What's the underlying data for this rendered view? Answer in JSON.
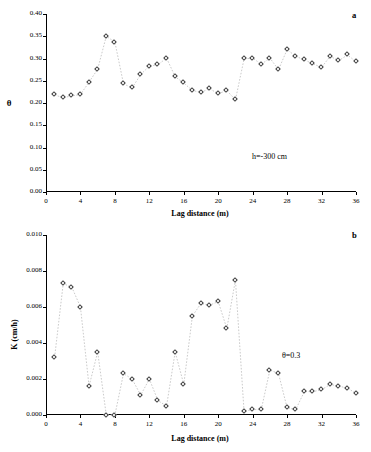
{
  "figure": {
    "panel_a_letter": "a",
    "panel_b_letter": "b"
  },
  "chart_data": [
    {
      "type": "scatter",
      "panel": "a",
      "title": "",
      "xlabel": "Lag distance (m)",
      "ylabel": "θ",
      "annotation": "h=-300 cm",
      "xlim": [
        0,
        36
      ],
      "ylim": [
        0.0,
        0.4
      ],
      "xticks": [
        0,
        4,
        8,
        12,
        16,
        20,
        24,
        28,
        32,
        36
      ],
      "yticks": [
        "0.00",
        "0.05",
        "0.10",
        "0.15",
        "0.20",
        "0.25",
        "0.30",
        "0.35",
        "0.40"
      ],
      "grid": false,
      "legend": "none",
      "marker": "open-diamond",
      "line": "dotted-gray",
      "x": [
        1,
        2,
        3,
        4,
        5,
        6,
        7,
        8,
        9,
        10,
        11,
        12,
        13,
        14,
        15,
        16,
        17,
        18,
        19,
        20,
        21,
        22,
        23,
        24,
        25,
        26,
        27,
        28,
        29,
        30,
        31,
        32,
        33,
        34,
        35,
        36
      ],
      "y": [
        0.218,
        0.212,
        0.216,
        0.219,
        0.247,
        0.276,
        0.35,
        0.337,
        0.243,
        0.234,
        0.264,
        0.283,
        0.286,
        0.301,
        0.259,
        0.245,
        0.228,
        0.224,
        0.232,
        0.221,
        0.228,
        0.207,
        0.299,
        0.301,
        0.287,
        0.301,
        0.275,
        0.32,
        0.305,
        0.297,
        0.288,
        0.28,
        0.305,
        0.295,
        0.308,
        0.293
      ]
    },
    {
      "type": "scatter",
      "panel": "b",
      "title": "",
      "xlabel": "Lag distance (m)",
      "ylabel": "K (cm/h)",
      "annotation": "θ=0.3",
      "xlim": [
        0,
        36
      ],
      "ylim": [
        0.0,
        0.01
      ],
      "xticks": [
        0,
        4,
        8,
        12,
        16,
        20,
        24,
        28,
        32,
        36
      ],
      "yticks": [
        "0.000",
        "0.002",
        "0.004",
        "0.006",
        "0.008",
        "0.010"
      ],
      "grid": false,
      "legend": "none",
      "marker": "open-diamond",
      "line": "dotted-gray",
      "x": [
        1,
        2,
        3,
        4,
        5,
        6,
        7,
        8,
        9,
        10,
        11,
        12,
        13,
        14,
        15,
        16,
        17,
        18,
        19,
        20,
        21,
        22,
        23,
        24,
        25,
        26,
        27,
        28,
        29,
        30,
        31,
        32,
        33,
        34,
        35,
        36
      ],
      "y": [
        0.0032,
        0.0073,
        0.0071,
        0.006,
        0.0016,
        0.0035,
        0.0,
        0.0,
        0.0023,
        0.002,
        0.0011,
        0.002,
        0.0008,
        0.0005,
        0.0035,
        0.0017,
        0.0055,
        0.0062,
        0.0061,
        0.0063,
        0.0048,
        0.0075,
        0.0002,
        0.0003,
        0.0003,
        0.0025,
        0.0023,
        0.0004,
        0.0003,
        0.0013,
        0.0013,
        0.0014,
        0.0017,
        0.0016,
        0.0015,
        0.0012
      ]
    }
  ]
}
